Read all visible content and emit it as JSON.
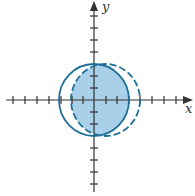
{
  "diagram": {
    "type": "coordinate-plane-circles",
    "axes": {
      "x_label": "x",
      "y_label": "y",
      "tick_spacing_px": 12,
      "origin": [
        94,
        100
      ]
    },
    "shapes": [
      {
        "name": "solid-circle",
        "style": "solid",
        "cx": 94,
        "cy": 100,
        "rx": 35,
        "ry": 36
      },
      {
        "name": "dashed-circle",
        "style": "dashed",
        "cx": 105.5,
        "cy": 100,
        "rx": 34.5,
        "ry": 36
      }
    ],
    "shaded_region": "intersection",
    "colors": {
      "stroke": "#1f6f99",
      "fill": "#a9d0e8",
      "axis": "#333333"
    }
  }
}
